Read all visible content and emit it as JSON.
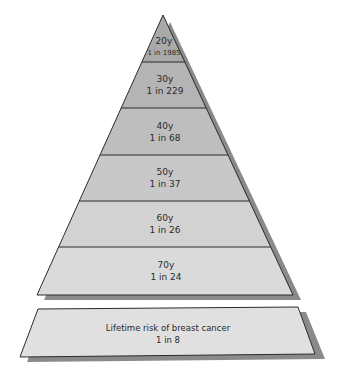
{
  "diagram": {
    "type": "pyramid",
    "levels": [
      {
        "age": "20y",
        "risk": "1 in 1985"
      },
      {
        "age": "30y",
        "risk": "1 in 229"
      },
      {
        "age": "40y",
        "risk": "1 in 68"
      },
      {
        "age": "50y",
        "risk": "1 in 37"
      },
      {
        "age": "60y",
        "risk": "1 in 26"
      },
      {
        "age": "70y",
        "risk": "1 in 24"
      }
    ],
    "base": {
      "title": "Lifetime risk of breast cancer",
      "risk": "1 in 8"
    },
    "colors": {
      "level_fills": [
        "#a9a9a9",
        "#b4b4b4",
        "#bebebe",
        "#c8c8c8",
        "#d2d2d2",
        "#dadada"
      ],
      "base_fill": "#e0e0e0",
      "shadow": "#8a8a8a",
      "outline": "#2b2b2b"
    }
  }
}
